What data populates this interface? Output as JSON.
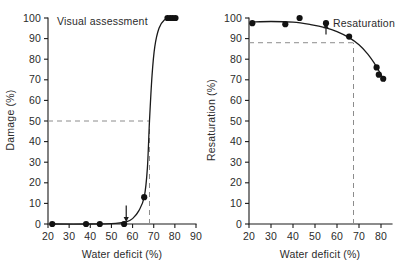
{
  "figure": {
    "background": "#ffffff",
    "ink": "#1a1a1a",
    "dash_color": "#8c8c8c"
  },
  "chart_data": [
    {
      "id": "left",
      "type": "scatter",
      "title": "Visual assessment",
      "xlabel": "Water deficit (%)",
      "ylabel": "Damage (%)",
      "xlim": [
        20,
        90
      ],
      "ylim": [
        0,
        100
      ],
      "xticks": [
        20,
        30,
        40,
        50,
        60,
        70,
        80,
        90
      ],
      "yticks": [
        0,
        10,
        20,
        30,
        40,
        50,
        60,
        70,
        80,
        90,
        100
      ],
      "xticklabels": [
        "20",
        "30",
        "40",
        "50",
        "60",
        "70",
        "80",
        "90"
      ],
      "yticklabels": [
        "0",
        "10",
        "20",
        "30",
        "40",
        "50",
        "60",
        "70",
        "80",
        "90",
        "100"
      ],
      "grid": false,
      "legend": "none",
      "points": [
        {
          "x": 22.0,
          "y": 0.0
        },
        {
          "x": 38.0,
          "y": 0.0
        },
        {
          "x": 44.5,
          "y": 0.0
        },
        {
          "x": 56.0,
          "y": 0.0
        },
        {
          "x": 65.5,
          "y": 13.0
        },
        {
          "x": 76.5,
          "y": 100.0
        },
        {
          "x": 77.8,
          "y": 100.0
        },
        {
          "x": 79.0,
          "y": 100.0
        },
        {
          "x": 80.3,
          "y": 100.0
        }
      ],
      "curve": [
        {
          "x": 22.0,
          "y": 0.0
        },
        {
          "x": 40.0,
          "y": 0.0
        },
        {
          "x": 52.0,
          "y": 0.3
        },
        {
          "x": 57.0,
          "y": 1.0
        },
        {
          "x": 60.0,
          "y": 2.6
        },
        {
          "x": 63.0,
          "y": 6.5
        },
        {
          "x": 65.5,
          "y": 13.0
        },
        {
          "x": 67.0,
          "y": 27.0
        },
        {
          "x": 68.0,
          "y": 50.0
        },
        {
          "x": 69.2,
          "y": 72.0
        },
        {
          "x": 70.5,
          "y": 86.0
        },
        {
          "x": 72.5,
          "y": 95.0
        },
        {
          "x": 75.0,
          "y": 99.0
        },
        {
          "x": 78.0,
          "y": 100.0
        },
        {
          "x": 80.5,
          "y": 100.0
        }
      ],
      "annotations": [
        {
          "kind": "h-dashed",
          "y": 50,
          "x_from": 20,
          "x_to": 68.0,
          "label": "50% damage threshold"
        },
        {
          "kind": "v-dashed",
          "x": 68.0,
          "y_from": 0,
          "y_to": 50,
          "label": "critical water deficit"
        },
        {
          "kind": "arrow-down",
          "x": 57.0,
          "y_from": 9.0,
          "y_to": 2.0,
          "label": "damage onset arrow"
        }
      ]
    },
    {
      "id": "right",
      "type": "scatter",
      "title": "Resaturation",
      "xlabel": "Water deficit (%)",
      "ylabel": "Resaturation (%)",
      "xlim": [
        20,
        85
      ],
      "ylim": [
        0,
        100
      ],
      "xticks": [
        20,
        30,
        40,
        50,
        60,
        70,
        80
      ],
      "yticks": [
        0,
        10,
        20,
        30,
        40,
        50,
        60,
        70,
        80,
        90,
        100
      ],
      "xticklabels": [
        "20",
        "30",
        "40",
        "50",
        "60",
        "70",
        "80"
      ],
      "yticklabels": [
        "0",
        "10",
        "20",
        "30",
        "40",
        "50",
        "60",
        "70",
        "80",
        "90",
        "100"
      ],
      "grid": false,
      "legend": "none",
      "points": [
        {
          "x": 21.5,
          "y": 97.5
        },
        {
          "x": 36.5,
          "y": 97.0
        },
        {
          "x": 43.0,
          "y": 100.0
        },
        {
          "x": 55.0,
          "y": 97.5
        },
        {
          "x": 65.5,
          "y": 91.0
        },
        {
          "x": 78.0,
          "y": 76.0
        },
        {
          "x": 79.0,
          "y": 72.5
        },
        {
          "x": 81.0,
          "y": 70.5
        }
      ],
      "curve": [
        {
          "x": 21.0,
          "y": 98.0
        },
        {
          "x": 30.0,
          "y": 98.3
        },
        {
          "x": 40.0,
          "y": 98.0
        },
        {
          "x": 48.0,
          "y": 96.8
        },
        {
          "x": 55.0,
          "y": 95.2
        },
        {
          "x": 60.0,
          "y": 93.4
        },
        {
          "x": 65.5,
          "y": 90.5
        },
        {
          "x": 70.0,
          "y": 87.0
        },
        {
          "x": 74.0,
          "y": 82.5
        },
        {
          "x": 77.0,
          "y": 78.0
        },
        {
          "x": 79.5,
          "y": 73.5
        },
        {
          "x": 81.5,
          "y": 69.5
        }
      ],
      "annotations": [
        {
          "kind": "h-dashed",
          "y": 88.0,
          "x_from": 20,
          "x_to": 67.5,
          "label": "88% resaturation threshold"
        },
        {
          "kind": "v-dashed",
          "x": 67.5,
          "y_from": 0,
          "y_to": 88.0,
          "label": "critical water deficit"
        },
        {
          "kind": "arrow-up",
          "x": 55.0,
          "y_from": 92.0,
          "y_to": 96.5,
          "label": "resaturation marker arrow"
        }
      ]
    }
  ]
}
